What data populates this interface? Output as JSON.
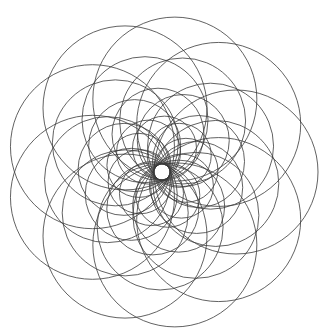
{
  "figure": {
    "background_color": "#ffffff",
    "stroke_color": "#3a3a3a",
    "center": [
      162,
      172
    ],
    "hole_radius": 8,
    "outer_radius": 155
  },
  "rings": [
    {
      "count": 9,
      "center_distance": 74,
      "radius": 82,
      "rotation": 0
    },
    {
      "count": 9,
      "center_distance": 55,
      "radius": 63,
      "rotation": 12
    },
    {
      "count": 9,
      "center_distance": 38,
      "radius": 46,
      "rotation": 24
    },
    {
      "count": 9,
      "center_distance": 24,
      "radius": 32,
      "rotation": 36
    }
  ]
}
